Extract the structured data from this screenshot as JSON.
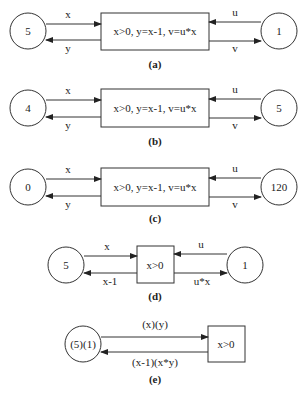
{
  "diagrams": [
    {
      "id": "a",
      "caption": "(a)",
      "left_place": "5",
      "right_place": "1",
      "transition": "x>0,  y=x-1, v=u*x",
      "arc_in_left": "x",
      "arc_out_left": "y",
      "arc_in_right": "u",
      "arc_out_right": "v"
    },
    {
      "id": "b",
      "caption": "(b)",
      "left_place": "4",
      "right_place": "5",
      "transition": "x>0,  y=x-1, v=u*x",
      "arc_in_left": "x",
      "arc_out_left": "y",
      "arc_in_right": "u",
      "arc_out_right": "v"
    },
    {
      "id": "c",
      "caption": "(c)",
      "left_place": "0",
      "right_place": "120",
      "transition": "x>0,  y=x-1, v=u*x",
      "arc_in_left": "x",
      "arc_out_left": "y",
      "arc_in_right": "u",
      "arc_out_right": "v"
    },
    {
      "id": "d",
      "caption": "(d)",
      "left_place": "5",
      "right_place": "1",
      "transition": "x>0",
      "arc_in_left": "x",
      "arc_out_left": "x-1",
      "arc_in_right": "u",
      "arc_out_right": "u*x"
    },
    {
      "id": "e",
      "caption": "(e)",
      "place": "(5)(1)",
      "transition": "x>0",
      "arc_in": "(x)(y)",
      "arc_out": "(x-1)(x*y)"
    }
  ]
}
